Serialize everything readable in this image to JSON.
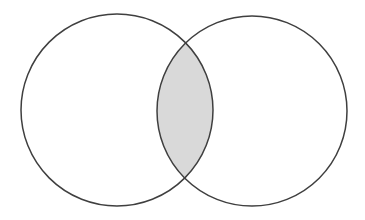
{
  "figure": {
    "width": 365,
    "height": 220,
    "background_color": "#ffffff"
  },
  "chart_data": {
    "type": "venn",
    "title": "",
    "subtitle": "",
    "xlabel": "",
    "ylabel": "",
    "grid": false,
    "legend_position": "none",
    "stroke_color": "#3f3f3f",
    "stroke_width": 1.5,
    "shaded_fill_color": "#d9d9d9",
    "unshaded_fill_color": "#ffffff",
    "sets": [
      {
        "name": "left-set",
        "label": "",
        "cx": 117,
        "cy": 110,
        "r": 96,
        "fill": "#d9d9d9",
        "shaded": true
      },
      {
        "name": "right-set",
        "label": "",
        "cx": 252,
        "cy": 111,
        "r": 95,
        "fill": "#ffffff",
        "shaded": false
      }
    ],
    "regions": [
      {
        "name": "left-only",
        "shaded": true,
        "fill": "#d9d9d9"
      },
      {
        "name": "intersection",
        "shaded": true,
        "fill": "#d9d9d9"
      },
      {
        "name": "right-only",
        "shaded": false,
        "fill": "#ffffff"
      },
      {
        "name": "outside",
        "shaded": false,
        "fill": "#ffffff"
      }
    ],
    "intersection_points": [
      {
        "x": 188,
        "y": 42
      },
      {
        "x": 188,
        "y": 183
      }
    ],
    "annotations": []
  }
}
